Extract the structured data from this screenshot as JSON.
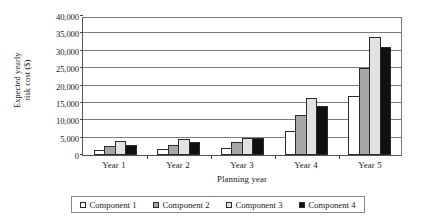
{
  "chart_data": {
    "type": "bar",
    "title": "",
    "xlabel": "Planning year",
    "ylabel": "Expected yearly risk cost ($)",
    "ylabel_line1": "Expected yearly",
    "ylabel_line2": "risk cost ($)",
    "categories": [
      "Year 1",
      "Year 2",
      "Year 3",
      "Year 4",
      "Year 5"
    ],
    "ylim": [
      0,
      40000
    ],
    "ytick_values": [
      0,
      5000,
      10000,
      15000,
      20000,
      25000,
      30000,
      35000,
      40000
    ],
    "ytick_labels": [
      "0",
      "5,000",
      "10,000",
      "15,000",
      "20,000",
      "25,000",
      "30,000",
      "35,000",
      "40,000"
    ],
    "grid": true,
    "legend_position": "bottom",
    "series": [
      {
        "name": "Component 1",
        "color": "#ffffff",
        "values": [
          1500,
          1800,
          2100,
          6800,
          17000
        ]
      },
      {
        "name": "Component 2",
        "color": "#a6a6a6",
        "values": [
          2600,
          2900,
          3800,
          11500,
          25000
        ]
      },
      {
        "name": "Component 3",
        "color": "#e2e2e2",
        "values": [
          4000,
          4500,
          5000,
          16500,
          34000
        ]
      },
      {
        "name": "Component 4",
        "color": "#101010",
        "values": [
          3000,
          3800,
          4800,
          14000,
          31000
        ]
      }
    ]
  }
}
